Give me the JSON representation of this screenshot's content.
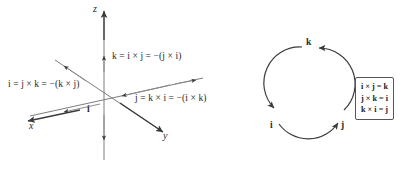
{
  "figure": {
    "left_panel": {
      "name": "3d-axes-diagram",
      "axes": [
        {
          "id": "x",
          "label": "x"
        },
        {
          "id": "y",
          "label": "y"
        },
        {
          "id": "z",
          "label": "z"
        }
      ],
      "vector_labels": [
        {
          "id": "i",
          "label": "i"
        }
      ],
      "equations": [
        {
          "id": "k-equation",
          "text": "k = i × j = −(j × i)"
        },
        {
          "id": "i-equation",
          "text": "i = j × k = −(k × j)"
        },
        {
          "id": "j-equation",
          "text": "j = k × i = −(i × k)"
        }
      ]
    },
    "right_panel": {
      "name": "cyclic-circle-diagram",
      "nodes": [
        {
          "id": "k",
          "label": "k",
          "position": "top"
        },
        {
          "id": "i",
          "label": "i",
          "position": "bottom-left"
        },
        {
          "id": "j",
          "label": "j",
          "position": "bottom-right"
        }
      ],
      "rule_box": {
        "lines": [
          "i × j = k",
          "j × k = i",
          "k × i = j"
        ]
      }
    },
    "colors": {
      "stroke": "#3a3a3a",
      "text": "#2a2a2a",
      "box_border": "#555555",
      "background": "#ffffff"
    }
  }
}
